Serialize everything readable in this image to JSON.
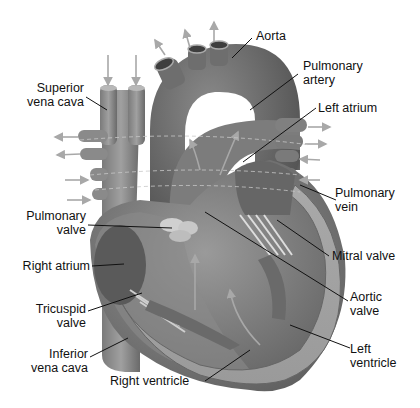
{
  "diagram": {
    "labels": {
      "aorta": "Aorta",
      "pulmonary_artery": [
        "Pulmonary",
        "artery"
      ],
      "left_atrium": "Left atrium",
      "superior_vena_cava": [
        "Superior",
        "vena cava"
      ],
      "pulmonary_vein": [
        "Pulmonary",
        "vein"
      ],
      "pulmonary_valve": [
        "Pulmonary",
        "valve"
      ],
      "mitral_valve": "Mitral valve",
      "right_atrium": "Right atrium",
      "aortic_valve": [
        "Aortic",
        "valve"
      ],
      "tricuspid_valve": [
        "Tricuspid",
        "valve"
      ],
      "left_ventricle": [
        "Left",
        "ventricle"
      ],
      "inferior_vena_cava": [
        "Inferior",
        "vena cava"
      ],
      "right_ventricle": "Right ventricle"
    },
    "colors": {
      "tissue_dark": "#6e6e6e",
      "tissue_mid": "#8c8c8c",
      "tissue_light": "#b5b5b5",
      "arrow": "#a8a8a8",
      "leader_line": "#111111",
      "text": "#111111"
    }
  }
}
